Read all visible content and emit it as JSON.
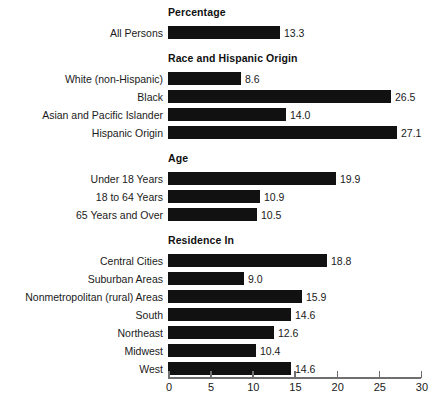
{
  "chart_data": {
    "type": "bar",
    "orientation": "horizontal",
    "title": "",
    "xlabel": "",
    "ylabel": "",
    "xlim": [
      0,
      30
    ],
    "x_ticks": [
      0,
      5,
      10,
      15,
      20,
      25,
      30
    ],
    "x_tick_labels": [
      "0",
      "5",
      "10",
      "15",
      "20",
      "25",
      "30"
    ],
    "grid": false,
    "legend": null,
    "bar_color": "#111111",
    "axis_color": "#6f6f6f",
    "value_label_format": "one decimal",
    "sections": [
      {
        "header": "Percentage",
        "rows": [
          {
            "label": "All Persons",
            "value": 13.3,
            "value_label": "13.3"
          }
        ]
      },
      {
        "header": "Race and Hispanic Origin",
        "rows": [
          {
            "label": "White (non-Hispanic)",
            "value": 8.6,
            "value_label": "8.6"
          },
          {
            "label": "Black",
            "value": 26.5,
            "value_label": "26.5"
          },
          {
            "label": "Asian and Pacific Islander",
            "value": 14.0,
            "value_label": "14.0"
          },
          {
            "label": "Hispanic Origin",
            "value": 27.1,
            "value_label": "27.1"
          }
        ]
      },
      {
        "header": "Age",
        "rows": [
          {
            "label": "Under 18 Years",
            "value": 19.9,
            "value_label": "19.9"
          },
          {
            "label": "18 to 64 Years",
            "value": 10.9,
            "value_label": "10.9"
          },
          {
            "label": "65 Years and Over",
            "value": 10.5,
            "value_label": "10.5"
          }
        ]
      },
      {
        "header": "Residence In",
        "rows": [
          {
            "label": "Central Cities",
            "value": 18.8,
            "value_label": "18.8"
          },
          {
            "label": "Suburban Areas",
            "value": 9.0,
            "value_label": "9.0"
          },
          {
            "label": "Nonmetropolitan (rural) Areas",
            "value": 15.9,
            "value_label": "15.9"
          },
          {
            "label": "South",
            "value": 14.6,
            "value_label": "14.6"
          },
          {
            "label": "Northeast",
            "value": 12.6,
            "value_label": "12.6"
          },
          {
            "label": "Midwest",
            "value": 10.4,
            "value_label": "10.4"
          },
          {
            "label": "West",
            "value": 14.6,
            "value_label": "14.6"
          }
        ]
      }
    ]
  },
  "layout": {
    "axis_x0_px": 168,
    "axis_x1_px": 421,
    "px_per_unit": 8.4333,
    "bar_height_px": 13,
    "row_pitch_px": 18,
    "section_header_offset_px": 20,
    "first_header_top_px": 6
  }
}
